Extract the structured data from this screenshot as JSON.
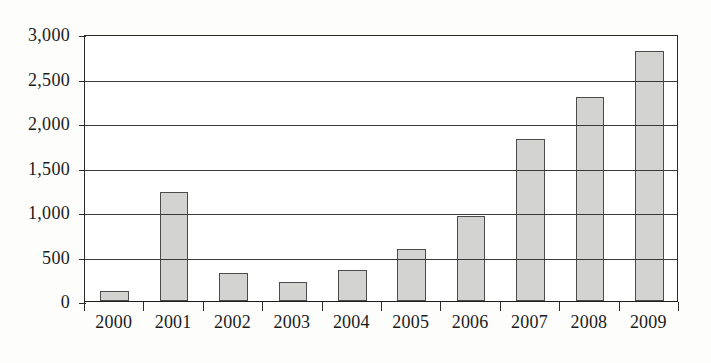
{
  "chart_data": {
    "type": "bar",
    "title": "",
    "xlabel": "",
    "ylabel": "",
    "categories": [
      "2000",
      "2001",
      "2002",
      "2003",
      "2004",
      "2005",
      "2006",
      "2007",
      "2008",
      "2009"
    ],
    "values": [
      110,
      1230,
      320,
      215,
      345,
      590,
      950,
      1820,
      2290,
      2810
    ],
    "ylim": [
      0,
      3000
    ],
    "ytick_labels": [
      "0",
      "500",
      "1,000",
      "1,500",
      "2,000",
      "2,500",
      "3,000"
    ],
    "ytick_values": [
      0,
      500,
      1000,
      1500,
      2000,
      2500,
      3000
    ],
    "grid": true,
    "legend": "none",
    "bar_color": "#d3d3d1",
    "bar_edge_color": "#4b4b4b",
    "axis_color": "#2a2a2a",
    "background_color": "#fdfdfc"
  }
}
